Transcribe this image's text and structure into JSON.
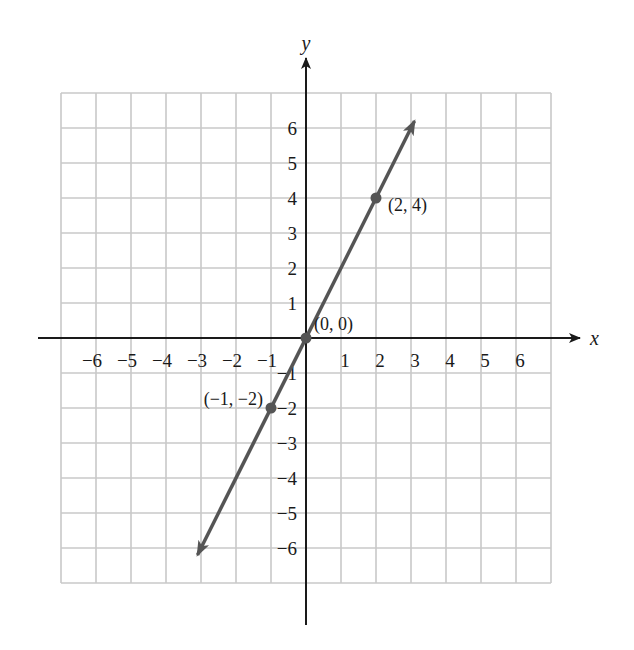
{
  "chart_data": {
    "type": "line",
    "title": "",
    "xlabel": "x",
    "ylabel": "y",
    "xlim": [
      -7,
      7
    ],
    "ylim": [
      -7,
      7
    ],
    "grid": true,
    "x_ticks": [
      -6,
      -5,
      -4,
      -3,
      -2,
      -1,
      1,
      2,
      3,
      4,
      5,
      6
    ],
    "y_ticks": [
      -6,
      -5,
      -4,
      -3,
      -2,
      -1,
      1,
      2,
      3,
      4,
      5,
      6
    ],
    "x_tick_labels": [
      "−6",
      "−5",
      "−4",
      "−3",
      "−2",
      "−1",
      "1",
      "2",
      "3",
      "4",
      "5",
      "6"
    ],
    "y_tick_labels": [
      "−6",
      "−5",
      "−4",
      "−3",
      "−2",
      "−1",
      "1",
      "2",
      "3",
      "4",
      "5",
      "6"
    ],
    "series": [
      {
        "name": "y = 2x",
        "line_endpoints": [
          [
            -3.1,
            -6.2
          ],
          [
            3.1,
            6.2
          ]
        ],
        "arrows_both_ends": true,
        "points": [
          {
            "x": -1,
            "y": -2,
            "label": "(−1,  −2)"
          },
          {
            "x": 0,
            "y": 0,
            "label": "(0, 0)"
          },
          {
            "x": 2,
            "y": 4,
            "label": "(2, 4)"
          }
        ]
      }
    ],
    "colors": {
      "grid": "#c8c8c8",
      "axis": "#1a1a1a",
      "line": "#555555"
    }
  }
}
